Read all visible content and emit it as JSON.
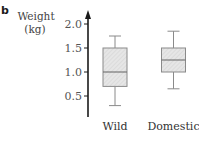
{
  "panel_label": "b",
  "chart_data": {
    "type": "box",
    "title": "",
    "xlabel": "",
    "ylabel": "Weight (kg)",
    "ylabel_lines": [
      "Weight",
      "(kg)"
    ],
    "yticks": [
      0.5,
      1.0,
      1.5,
      2.0
    ],
    "ytick_labels": [
      "0.5",
      "1.0",
      "1.5",
      "2.0"
    ],
    "ylim": [
      0,
      2.2
    ],
    "grid": false,
    "legend": null,
    "categories": [
      "Wild",
      "Domestic"
    ],
    "series": [
      {
        "name": "Wild",
        "min": 0.3,
        "q1": 0.7,
        "median": 1.0,
        "q3": 1.5,
        "max": 1.75
      },
      {
        "name": "Domestic",
        "min": 0.65,
        "q1": 1.0,
        "median": 1.25,
        "q3": 1.5,
        "max": 1.85
      }
    ]
  },
  "colors": {
    "axis": "#1a1a1a",
    "box_fill": "#e4e4e4",
    "box_hatch": "#c8c8c8",
    "box_stroke": "#8a8a8a",
    "text": "#444444"
  }
}
